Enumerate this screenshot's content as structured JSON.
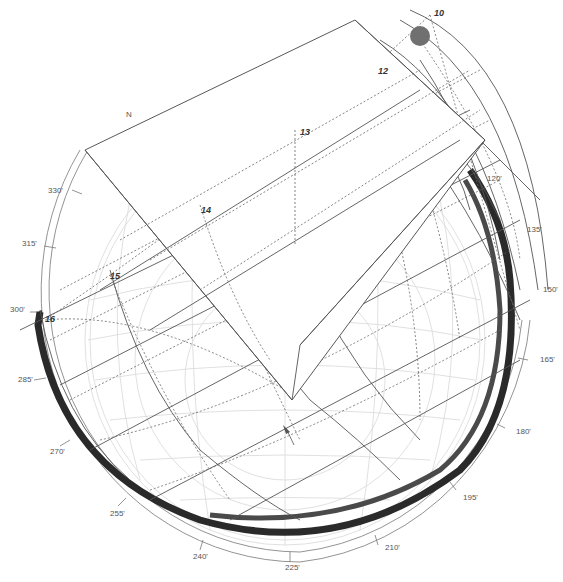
{
  "diagram": {
    "type": "3d-sun-path-shading",
    "north_label": "N",
    "colors": {
      "background": "#ffffff",
      "line": "#555555",
      "dotted": "#666666",
      "faint_grid": "#d8d8d8",
      "band_dark": "#2a2a2a",
      "band_mid": "#4a4a4a",
      "sun": "#707070"
    },
    "azimuth_labels": [
      {
        "text": "330'",
        "x": 48,
        "y": 193
      },
      {
        "text": "315'",
        "x": 22,
        "y": 246
      },
      {
        "text": "300'",
        "x": 10,
        "y": 312
      },
      {
        "text": "285'",
        "x": 18,
        "y": 382
      },
      {
        "text": "270'",
        "x": 50,
        "y": 454
      },
      {
        "text": "255'",
        "x": 110,
        "y": 516
      },
      {
        "text": "240'",
        "x": 193,
        "y": 559
      },
      {
        "text": "225'",
        "x": 285,
        "y": 568
      },
      {
        "text": "210'",
        "x": 385,
        "y": 550
      },
      {
        "text": "195'",
        "x": 463,
        "y": 500
      },
      {
        "text": "180'",
        "x": 516,
        "y": 434
      },
      {
        "text": "165'",
        "x": 540,
        "y": 362
      },
      {
        "text": "150'",
        "x": 543,
        "y": 292
      },
      {
        "text": "135'",
        "x": 527,
        "y": 232
      },
      {
        "text": "120'",
        "x": 487,
        "y": 181
      }
    ],
    "hour_labels": [
      {
        "text": "10",
        "x": 434,
        "y": 16
      },
      {
        "text": "12",
        "x": 378,
        "y": 74
      },
      {
        "text": "13",
        "x": 300,
        "y": 135
      },
      {
        "text": "14",
        "x": 201,
        "y": 211
      },
      {
        "text": "15",
        "x": 110,
        "y": 277
      },
      {
        "text": "16",
        "x": 45,
        "y": 320
      }
    ],
    "sun_marker": {
      "cx": 420,
      "cy": 36,
      "r": 10
    }
  }
}
